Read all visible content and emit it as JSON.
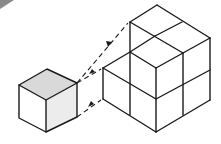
{
  "diagram": {
    "colors": {
      "line": "#1a1a1a",
      "top_face_shaded": "#d9d9d9",
      "right_face_shaded": "#ececec",
      "background": "#ffffff",
      "corner_shade": "#8a8a8a"
    },
    "small_cube": {
      "label": "unit cube",
      "vertices": {
        "top": [
          47,
          69
        ],
        "left": [
          19,
          85
        ],
        "right": [
          77,
          83
        ],
        "center": [
          46,
          100
        ],
        "left_bottom": [
          19,
          118
        ],
        "bottom": [
          46,
          132
        ],
        "right_bottom": [
          77,
          117
        ]
      }
    },
    "large_structure": {
      "label": "2x2x2 arrangement of unit cubes",
      "cube_count_visible": 7
    },
    "arrows": [
      {
        "from": [
          77,
          83
        ],
        "to": [
          130,
          22
        ],
        "style": "dashed"
      },
      {
        "from": [
          77,
          83
        ],
        "to": [
          103,
          68
        ],
        "style": "dashed"
      },
      {
        "from": [
          77,
          117
        ],
        "to": [
          103,
          99
        ],
        "style": "dashed"
      }
    ]
  }
}
